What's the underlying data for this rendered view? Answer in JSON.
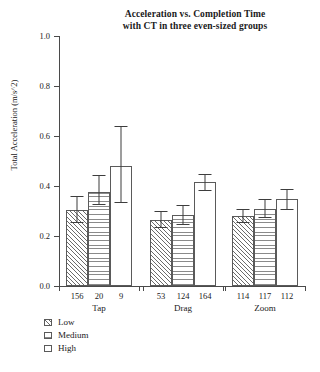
{
  "chart_data": {
    "type": "bar",
    "title": "Acceleration vs. Completion Time with CT in three even-sized groups",
    "title_lines": [
      "Acceleration vs. Completion Time",
      "with CT in three even-sized groups"
    ],
    "xlabel": "",
    "ylabel": "Total Acceleration (m/s^2)",
    "ylim": [
      0.0,
      1.0
    ],
    "ytick_labels": [
      "1.0",
      "0.8",
      "0.6",
      "0.4",
      "0.2",
      "0.0"
    ],
    "ytick_values": [
      1.0,
      0.8,
      0.6,
      0.4,
      0.2,
      0.0
    ],
    "grid": false,
    "legend_position": "below-left",
    "categories": [
      "Tap",
      "Drag",
      "Zoom"
    ],
    "series": [
      {
        "name": "Low",
        "pattern": "diagonal-hatch",
        "values": [
          0.305,
          0.265,
          0.28
        ],
        "err_low": [
          0.255,
          0.235,
          0.255
        ],
        "err_high": [
          0.36,
          0.3,
          0.31
        ],
        "counts": [
          156,
          53,
          114
        ]
      },
      {
        "name": "Medium",
        "pattern": "horizontal-lines",
        "values": [
          0.375,
          0.285,
          0.31
        ],
        "err_low": [
          0.33,
          0.25,
          0.275
        ],
        "err_high": [
          0.445,
          0.325,
          0.35
        ],
        "counts": [
          20,
          124,
          117
        ]
      },
      {
        "name": "High",
        "pattern": "plain-white",
        "values": [
          0.48,
          0.415,
          0.35
        ],
        "err_low": [
          0.335,
          0.385,
          0.31
        ],
        "err_high": [
          0.64,
          0.45,
          0.39
        ],
        "counts": [
          9,
          164,
          112
        ]
      }
    ],
    "bar_counts_flat": [
      "156",
      "20",
      "9",
      "53",
      "124",
      "164",
      "114",
      "117",
      "112"
    ]
  },
  "legend": {
    "items": [
      {
        "label": "Low"
      },
      {
        "label": "Medium"
      },
      {
        "label": "High"
      }
    ]
  },
  "colors": {
    "axis": "#4a4a4a",
    "bar_edge": "#5a5a5a",
    "error_bar": "#3d3d3d",
    "text": "#1a1a1a",
    "background": "#ffffff"
  }
}
